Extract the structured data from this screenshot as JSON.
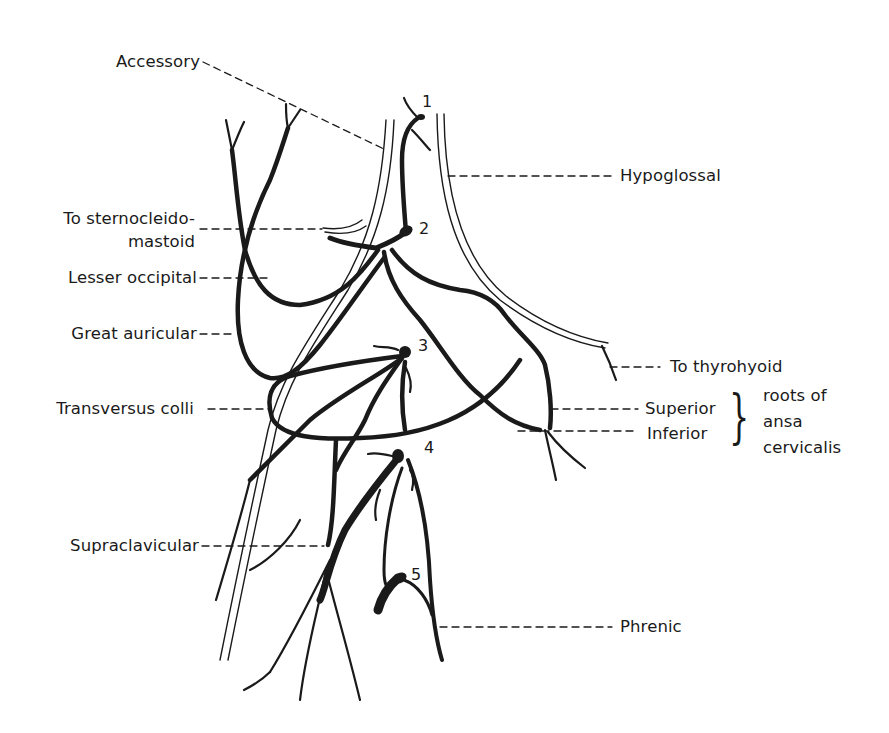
{
  "figure": {
    "style": "black line illustration on white",
    "colors": {
      "ink": "#1a1a1a",
      "background": "#ffffff"
    }
  },
  "labels": {
    "accessory": "Accessory",
    "hypoglossal": "Hypoglossal",
    "to_sternocleidomastoid_line1": "To sternocleido-",
    "to_sternocleidomastoid_line2": "mastoid",
    "lesser_occipital": "Lesser occipital",
    "great_auricular": "Great auricular",
    "to_thyrohyoid": "To thyrohyoid",
    "transversus_colli": "Transversus colli",
    "superior": "Superior",
    "inferior": "Inferior",
    "roots_of_line1": "roots of",
    "roots_of_line2": "ansa",
    "roots_of_line3": "cervicalis",
    "supraclavicular": "Supraclavicular",
    "phrenic": "Phrenic"
  },
  "nerve_numbers": [
    "1",
    "2",
    "3",
    "4",
    "5"
  ],
  "brace_glyph": "}"
}
